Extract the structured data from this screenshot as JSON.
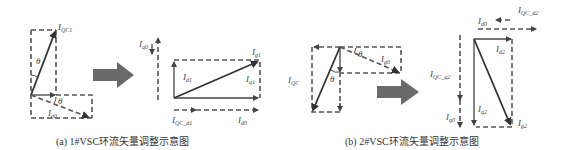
{
  "figure": {
    "panel_a": {
      "caption": "(a) 1#VSC环流矢量调整示意图",
      "left_diagram": {
        "labels": {
          "i_qc1": "I",
          "i_qc1_sub": "QC1",
          "theta_top": "θ",
          "theta_bottom": "θ",
          "i_g0": "I",
          "i_g0_sub": "g0"
        }
      },
      "arrow": "big-right-arrow",
      "right_diagram": {
        "labels": {
          "i_q0": "I",
          "i_q0_sub": "q0",
          "i_g1": "I",
          "i_g1_sub": "g1",
          "i_d1": "I",
          "i_d1_sub": "d1",
          "i_q1": "I",
          "i_q1_sub": "q1",
          "i_qc_d1": "I",
          "i_qc_d1_sub": "QC_d1",
          "i_d0": "I",
          "i_d0_sub": "d0"
        }
      }
    },
    "panel_b": {
      "caption": "(b) 2#VSC环流矢量调整示意图",
      "left_diagram": {
        "labels": {
          "i_qc": "I",
          "i_qc_sub": "QC",
          "theta_top": "θ",
          "theta_bottom": "θ",
          "i_g0": "I",
          "i_g0_sub": "g0"
        }
      },
      "arrow": "big-right-arrow",
      "right_diagram": {
        "labels": {
          "i_d0": "I",
          "i_d0_sub": "d0",
          "i_qc_d2": "I",
          "i_qc_d2_sub": "QC_d2",
          "i_d2": "I",
          "i_d2_sub": "d2",
          "i_qc_q2": "I",
          "i_qc_q2_sub": "QC_q2",
          "i_q0": "I",
          "i_q0_sub": "q0",
          "i_q2": "I",
          "i_q2_sub": "q2",
          "i_g2": "I",
          "i_g2_sub": "g2"
        }
      }
    },
    "colors": {
      "line": "#444444",
      "arrow_fill": "#666666",
      "background": "#ffffff"
    }
  }
}
